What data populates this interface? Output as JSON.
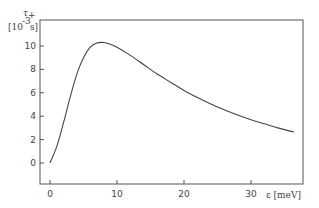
{
  "chart_data": {
    "type": "line",
    "title": "",
    "xlabel": "ε [meV]",
    "ylabel": "τ₊ [10⁻³ s]",
    "ylabel_parts": {
      "symbol": "τ",
      "subscript": "+",
      "unit_open": "[10",
      "unit_exp": "-3",
      "unit_close": "s]"
    },
    "xlim": [
      -1.5,
      38
    ],
    "ylim": [
      -1.5,
      12
    ],
    "x_ticks": [
      0,
      10,
      20,
      30
    ],
    "y_ticks": [
      0,
      2,
      4,
      6,
      8,
      10
    ],
    "grid": false,
    "legend": null,
    "series": [
      {
        "name": "tau_plus",
        "x": [
          0,
          1,
          2,
          3,
          4,
          5,
          6,
          7,
          8,
          9,
          10,
          12,
          14,
          16,
          18,
          20,
          22,
          24,
          26,
          28,
          30,
          32,
          34,
          36.4
        ],
        "y": [
          0,
          1.4,
          3.4,
          5.6,
          7.6,
          9.0,
          9.9,
          10.25,
          10.3,
          10.15,
          9.9,
          9.2,
          8.4,
          7.6,
          6.9,
          6.2,
          5.6,
          5.05,
          4.55,
          4.1,
          3.7,
          3.35,
          3.0,
          2.65
        ]
      }
    ]
  }
}
